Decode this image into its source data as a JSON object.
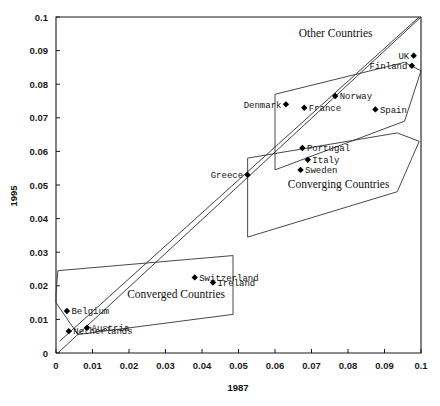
{
  "chart_data": {
    "type": "scatter",
    "title": "",
    "xlabel": "1987",
    "ylabel": "1995",
    "xlim": [
      0,
      0.1
    ],
    "ylim": [
      0,
      0.1
    ],
    "grid": false,
    "legend": "none",
    "xticks": [
      "0",
      "0.01",
      "0.02",
      "0.03",
      "0.04",
      "0.05",
      "0.06",
      "0.07",
      "0.08",
      "0.09",
      "0.1"
    ],
    "xtick_values": [
      0,
      0.01,
      0.02,
      0.03,
      0.04,
      0.05,
      0.06,
      0.07,
      0.08,
      0.09,
      0.1
    ],
    "yticks": [
      "0",
      "0.01",
      "0.02",
      "0.03",
      "0.04",
      "0.05",
      "0.06",
      "0.07",
      "0.08",
      "0.09",
      "0.1"
    ],
    "ytick_values": [
      0,
      0.01,
      0.02,
      0.03,
      0.04,
      0.05,
      0.06,
      0.07,
      0.08,
      0.09,
      0.1
    ],
    "points": [
      {
        "label": "Belgium",
        "x": 0.003,
        "y": 0.0125,
        "label_side": "right"
      },
      {
        "label": "Netherlands",
        "x": 0.0035,
        "y": 0.0065,
        "label_side": "right"
      },
      {
        "label": "Austria",
        "x": 0.0085,
        "y": 0.0075,
        "label_side": "right"
      },
      {
        "label": "Switzerland",
        "x": 0.038,
        "y": 0.0225,
        "label_side": "right"
      },
      {
        "label": "Ireland",
        "x": 0.043,
        "y": 0.021,
        "label_side": "right"
      },
      {
        "label": "Greece",
        "x": 0.0525,
        "y": 0.053,
        "label_side": "left"
      },
      {
        "label": "Sweden",
        "x": 0.067,
        "y": 0.0545,
        "label_side": "right"
      },
      {
        "label": "Italy",
        "x": 0.069,
        "y": 0.0575,
        "label_side": "right"
      },
      {
        "label": "Portugal",
        "x": 0.0675,
        "y": 0.061,
        "label_side": "right"
      },
      {
        "label": "Denmark",
        "x": 0.063,
        "y": 0.074,
        "label_side": "left"
      },
      {
        "label": "France",
        "x": 0.068,
        "y": 0.073,
        "label_side": "right"
      },
      {
        "label": "Norway",
        "x": 0.0765,
        "y": 0.0765,
        "label_side": "right"
      },
      {
        "label": "Spain",
        "x": 0.0875,
        "y": 0.0725,
        "label_side": "right"
      },
      {
        "label": "UK",
        "x": 0.098,
        "y": 0.0885,
        "label_side": "left"
      },
      {
        "label": "Finland",
        "x": 0.0975,
        "y": 0.0855,
        "label_side": "left"
      }
    ],
    "trend_lines": [
      {
        "name": "identity-line",
        "x1": 0.0005,
        "y1": 0.0,
        "x2": 0.1,
        "y2": 0.1
      },
      {
        "name": "regression-line",
        "x1": 0.001,
        "y1": 0.0035,
        "x2": 0.0995,
        "y2": 0.1
      }
    ],
    "regions": [
      {
        "name": "converged-countries",
        "label": "Converged Countries",
        "label_x": 0.0195,
        "label_y": 0.0165,
        "vertices": [
          [
            0.0,
            0.0175
          ],
          [
            0.0005,
            0.0245
          ],
          [
            0.0485,
            0.029
          ],
          [
            0.0485,
            0.0115
          ],
          [
            0.006,
            0.0055
          ],
          [
            0.0,
            0.015
          ]
        ]
      },
      {
        "name": "converging-countries",
        "label": "Converging Countries",
        "label_x": 0.0635,
        "label_y": 0.049,
        "vertices": [
          [
            0.0525,
            0.058
          ],
          [
            0.0525,
            0.0345
          ],
          [
            0.0935,
            0.048
          ],
          [
            0.0995,
            0.063
          ],
          [
            0.0935,
            0.0655
          ],
          [
            0.0525,
            0.058
          ]
        ]
      },
      {
        "name": "other-countries",
        "label": "Other Countries",
        "label_x": 0.0665,
        "label_y": 0.094,
        "vertices": [
          [
            0.06,
            0.077
          ],
          [
            0.06,
            0.0545
          ],
          [
            0.0955,
            0.069
          ],
          [
            0.1,
            0.084
          ],
          [
            0.0955,
            0.0865
          ],
          [
            0.06,
            0.077
          ]
        ]
      }
    ]
  }
}
